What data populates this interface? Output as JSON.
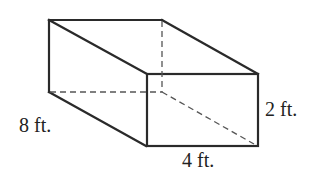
{
  "diagram": {
    "type": "rectangular-prism",
    "colors": {
      "edge": "#2a2a2a",
      "hidden_edge": "#555555",
      "background": "#ffffff"
    },
    "labels": {
      "depth": "8 ft.",
      "height": "2 ft.",
      "width": "4 ft."
    },
    "dimensions": {
      "length_ft": 8,
      "width_ft": 4,
      "height_ft": 2
    }
  }
}
